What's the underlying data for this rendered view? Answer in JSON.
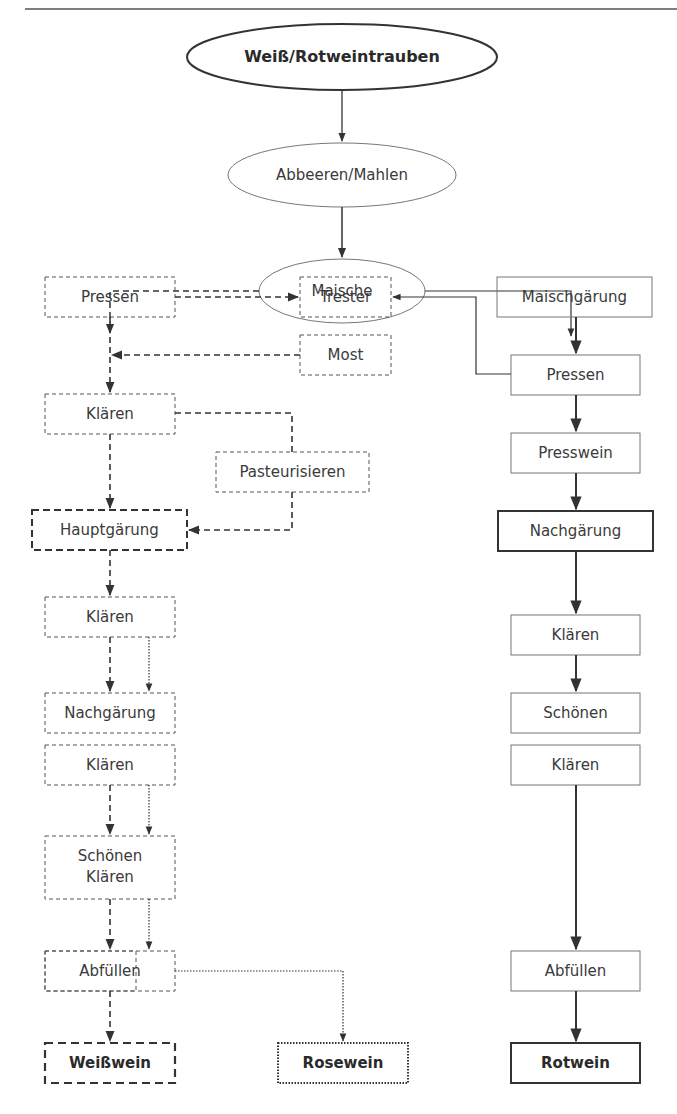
{
  "diagram": {
    "title_node": "Weiß/Rotweintrauben",
    "nodes": {
      "start": "Weiß/Rotweintrauben",
      "abbeeren": "Abbeeren/Mahlen",
      "maische": "Maische",
      "w_pressen": "Pressen",
      "trester": "Trester",
      "most": "Most",
      "w_klaeren1": "Klären",
      "pasteurisieren": "Pasteurisieren",
      "hauptgaerung": "Hauptgärung",
      "w_klaeren2": "Klären",
      "w_nachgaerung": "Nachgärung",
      "w_klaeren3": "Klären",
      "w_schoenen_1": "Schönen",
      "w_schoenen_2": "Klären",
      "w_abfuellen": "Abfüllen",
      "weisswein": "Weißwein",
      "rosewein": "Rosewein",
      "maischgaerung": "Maischgärung",
      "r_pressen": "Pressen",
      "presswein": "Presswein",
      "r_nachgaerung": "Nachgärung",
      "r_klaeren1": "Klären",
      "r_schoenen": "Schönen",
      "r_klaeren2": "Klären",
      "r_abfuellen": "Abfüllen",
      "rotwein": "Rotwein"
    },
    "line_styles": {
      "weisswein_path": "dashed",
      "rosewein_path": "dotted",
      "rotwein_path": "solid"
    },
    "colors": {
      "stroke": "#333333",
      "light_stroke": "#777777",
      "text": "#3a3a3a"
    }
  }
}
